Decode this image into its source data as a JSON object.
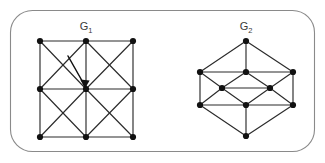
{
  "figure": {
    "background_color": "#ffffff",
    "frame": {
      "x": 10.5,
      "y": 10.5,
      "width": 304,
      "height": 141,
      "radius": 22,
      "stroke_color": "#8a8a8a"
    },
    "edge_color": "#2b2b2b",
    "node_color": "#111111",
    "node_radius": 3.1,
    "label_color": "#3a3a3a"
  },
  "graphs": [
    {
      "id": "g1",
      "label_main": "G",
      "label_sub": "1",
      "label_x": 86,
      "label_y": 30,
      "description": "3 by 3 grid graph with both diagonals in every cell",
      "nodes": [
        {
          "id": "n00",
          "x": 40,
          "y": 41
        },
        {
          "id": "n10",
          "x": 86,
          "y": 41
        },
        {
          "id": "n20",
          "x": 133,
          "y": 41
        },
        {
          "id": "n01",
          "x": 40,
          "y": 89
        },
        {
          "id": "n11",
          "x": 86,
          "y": 89
        },
        {
          "id": "n21",
          "x": 133,
          "y": 89
        },
        {
          "id": "n02",
          "x": 40,
          "y": 137
        },
        {
          "id": "n12",
          "x": 86,
          "y": 137
        },
        {
          "id": "n22",
          "x": 133,
          "y": 137
        }
      ],
      "edges": [
        [
          "n00",
          "n10"
        ],
        [
          "n10",
          "n20"
        ],
        [
          "n01",
          "n11"
        ],
        [
          "n11",
          "n21"
        ],
        [
          "n02",
          "n12"
        ],
        [
          "n12",
          "n22"
        ],
        [
          "n00",
          "n01"
        ],
        [
          "n01",
          "n02"
        ],
        [
          "n10",
          "n11"
        ],
        [
          "n11",
          "n12"
        ],
        [
          "n20",
          "n21"
        ],
        [
          "n21",
          "n22"
        ],
        [
          "n00",
          "n11"
        ],
        [
          "n10",
          "n01"
        ],
        [
          "n10",
          "n21"
        ],
        [
          "n20",
          "n11"
        ],
        [
          "n01",
          "n12"
        ],
        [
          "n11",
          "n02"
        ],
        [
          "n11",
          "n22"
        ],
        [
          "n21",
          "n12"
        ]
      ]
    },
    {
      "id": "g2",
      "label_main": "G",
      "label_sub": "2",
      "label_x": 246,
      "label_y": 30,
      "description": "Nine node hexagonal drawing with nested rhombus structure",
      "nodes": [
        {
          "id": "t",
          "x": 246,
          "y": 41
        },
        {
          "id": "ul",
          "x": 200,
          "y": 72
        },
        {
          "id": "uc",
          "x": 246,
          "y": 72
        },
        {
          "id": "ur",
          "x": 293,
          "y": 72
        },
        {
          "id": "ml",
          "x": 222,
          "y": 88
        },
        {
          "id": "mr",
          "x": 270,
          "y": 88
        },
        {
          "id": "ll",
          "x": 200,
          "y": 105
        },
        {
          "id": "lc",
          "x": 246,
          "y": 105
        },
        {
          "id": "lr",
          "x": 293,
          "y": 105
        },
        {
          "id": "b",
          "x": 246,
          "y": 136
        }
      ],
      "edges": [
        [
          "t",
          "ul"
        ],
        [
          "t",
          "uc"
        ],
        [
          "t",
          "ur"
        ],
        [
          "ul",
          "uc"
        ],
        [
          "uc",
          "ur"
        ],
        [
          "ul",
          "ll"
        ],
        [
          "ur",
          "lr"
        ],
        [
          "ul",
          "ml"
        ],
        [
          "ml",
          "uc"
        ],
        [
          "uc",
          "mr"
        ],
        [
          "mr",
          "ur"
        ],
        [
          "ml",
          "mr"
        ],
        [
          "ml",
          "lc"
        ],
        [
          "lc",
          "mr"
        ],
        [
          "ll",
          "ml"
        ],
        [
          "mr",
          "lr"
        ],
        [
          "ll",
          "lc"
        ],
        [
          "lc",
          "lr"
        ],
        [
          "ll",
          "b"
        ],
        [
          "lc",
          "b"
        ],
        [
          "lr",
          "b"
        ]
      ]
    }
  ],
  "annotation": {
    "type": "arrow",
    "name": "center-vertex-pointer",
    "from_x": 68,
    "from_y": 56,
    "to_x": 85,
    "to_y": 86,
    "head_points": "85,88.5 80.2,79.6 89.6,80.6",
    "color": "#111111"
  }
}
